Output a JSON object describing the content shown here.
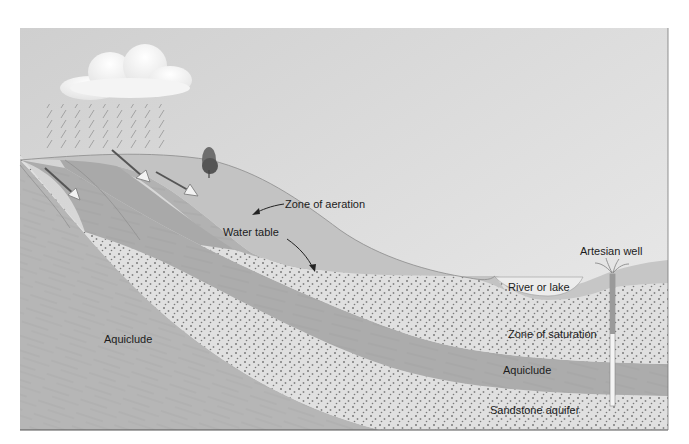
{
  "diagram": {
    "type": "geologic cross-section",
    "labels": {
      "zone_of_aeration": "Zone of aeration",
      "water_table": "Water table",
      "artesian_well": "Artesian well",
      "river_or_lake": "River or lake",
      "zone_of_saturation": "Zone of saturation",
      "aquiclude_upper": "Aquiclude",
      "aquiclude_lower": "Aquiclude",
      "sandstone_aquifer": "Sandstone aquifer"
    },
    "colors": {
      "sky": "#d2d2d2",
      "sky_light": "#e6e6e6",
      "ground_aeration": "#c4c4c4",
      "aquiclude": "#b4b4b4",
      "aquiclude_dark": "#a8a8a8",
      "saturated_sand": "#e0e0e0",
      "sand_dots": "#7a7a7a",
      "lake": "#ececec",
      "frame_line": "#555555",
      "text": "#1c1c1c"
    }
  }
}
